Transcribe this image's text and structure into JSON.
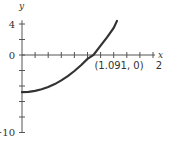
{
  "chart_data": {
    "type": "line",
    "title": "",
    "xlabel": "x",
    "ylabel": "y",
    "xlim": [
      0,
      2
    ],
    "ylim": [
      -10,
      5
    ],
    "x_ticks_step": 0.2,
    "y_ticks_step": 2,
    "x_tick_labels": [
      {
        "value": 2,
        "label": "2"
      }
    ],
    "y_tick_labels": [
      {
        "value": 4,
        "label": "4"
      },
      {
        "value": 0,
        "label": "0"
      },
      {
        "value": -10,
        "label": "-10"
      }
    ],
    "series": [
      {
        "name": "f(x)",
        "color": "#333333",
        "x": [
          0,
          0.1,
          0.2,
          0.3,
          0.4,
          0.5,
          0.6,
          0.7,
          0.8,
          0.9,
          1.0,
          1.091,
          1.2,
          1.3,
          1.4,
          1.45
        ],
        "y": [
          -4.8,
          -4.76,
          -4.63,
          -4.42,
          -4.13,
          -3.75,
          -3.28,
          -2.72,
          -2.07,
          -1.33,
          -0.5,
          0,
          1.2,
          2.3,
          3.5,
          4.4
        ]
      }
    ],
    "annotations": [
      {
        "text": "(1.091, 0)",
        "x": 1.091,
        "y": 0
      }
    ],
    "grid": false,
    "legend": "none"
  }
}
